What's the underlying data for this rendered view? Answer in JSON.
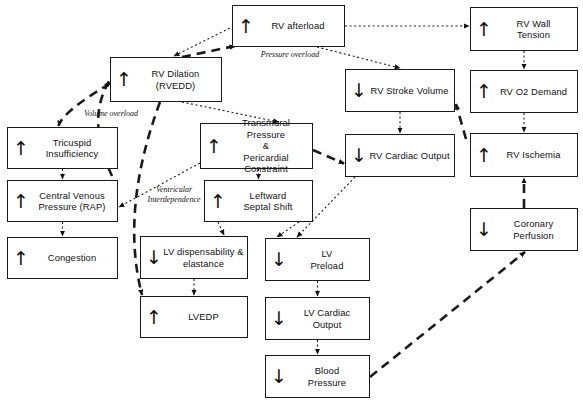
{
  "diagram": {
    "width": 583,
    "height": 404,
    "background": "#ffffff",
    "line_color": "#1a1a1a"
  },
  "nodes": [
    {
      "id": "rv_afterload",
      "label": "RV afterload",
      "arrow": "up",
      "x": 232,
      "y": 5,
      "w": 113,
      "h": 42
    },
    {
      "id": "rv_wall_tension",
      "label": "RV Wall\nTension",
      "arrow": "up",
      "x": 470,
      "y": 7,
      "w": 108,
      "h": 44
    },
    {
      "id": "rv_dilation",
      "label": "RV Dilation\n(RVEDD)",
      "arrow": "up",
      "x": 110,
      "y": 57,
      "w": 112,
      "h": 45
    },
    {
      "id": "rv_stroke_volume",
      "label": "RV Stroke Volume",
      "arrow": "down",
      "x": 345,
      "y": 69,
      "w": 110,
      "h": 43
    },
    {
      "id": "rv_o2_demand",
      "label": "RV O2 Demand",
      "arrow": "up",
      "x": 470,
      "y": 70,
      "w": 108,
      "h": 43
    },
    {
      "id": "tricuspid",
      "label": "Tricuspid\nInsufficiency",
      "arrow": "up",
      "x": 7,
      "y": 127,
      "w": 111,
      "h": 42
    },
    {
      "id": "transmural",
      "label": "Transmural Pressure\n&\nPericardial Constraint",
      "arrow": "up",
      "x": 200,
      "y": 123,
      "w": 113,
      "h": 46
    },
    {
      "id": "rv_cardiac_output",
      "label": "RV Cardiac Output",
      "arrow": "down",
      "x": 345,
      "y": 134,
      "w": 110,
      "h": 43
    },
    {
      "id": "rv_ischemia",
      "label": "RV Ischemia",
      "arrow": "up",
      "x": 470,
      "y": 133,
      "w": 108,
      "h": 44
    },
    {
      "id": "cvp",
      "label": "Central Venous\nPressure (RAP)",
      "arrow": "up",
      "x": 7,
      "y": 180,
      "w": 111,
      "h": 42
    },
    {
      "id": "septal_shift",
      "label": "Leftward\nSeptal Shift",
      "arrow": "up",
      "x": 204,
      "y": 180,
      "w": 109,
      "h": 42
    },
    {
      "id": "coronary_perfusion",
      "label": "Coronary Perfusion",
      "arrow": "down",
      "x": 470,
      "y": 208,
      "w": 108,
      "h": 43
    },
    {
      "id": "congestion",
      "label": "Congestion",
      "arrow": "up",
      "x": 7,
      "y": 237,
      "w": 111,
      "h": 42
    },
    {
      "id": "lv_dispensability",
      "label": "LV dispensability &\nelastance",
      "arrow": "down",
      "x": 140,
      "y": 236,
      "w": 108,
      "h": 43
    },
    {
      "id": "lv_preload",
      "label": "LV\nPreload",
      "arrow": "down",
      "x": 265,
      "y": 238,
      "w": 105,
      "h": 43
    },
    {
      "id": "lvedp",
      "label": "LVEDP",
      "arrow": "up",
      "x": 140,
      "y": 296,
      "w": 108,
      "h": 42
    },
    {
      "id": "lv_cardiac_output",
      "label": "LV Cardiac\nOutput",
      "arrow": "down",
      "x": 265,
      "y": 297,
      "w": 105,
      "h": 43
    },
    {
      "id": "blood_pressure",
      "label": "Blood\nPressure",
      "arrow": "down",
      "x": 265,
      "y": 355,
      "w": 105,
      "h": 43
    }
  ],
  "edge_labels": [
    {
      "id": "pressure_overload",
      "text": "Pressure overload",
      "x": 249,
      "y": 50,
      "w": 82
    },
    {
      "id": "volume_overload",
      "text": "Volume overload",
      "x": 73,
      "y": 109,
      "w": 76
    },
    {
      "id": "ventricular_interdependence",
      "text": "Ventricular\nInterdependence",
      "x": 141,
      "y": 185,
      "w": 66
    }
  ],
  "edges": [
    {
      "id": "rv_afterload-to-rv_wall_tension",
      "style": "dotted",
      "from": "rv_afterload",
      "to": "rv_wall_tension"
    },
    {
      "id": "rv_afterload-to-rv_dilation",
      "style": "dotted",
      "from": "rv_afterload",
      "to": "rv_dilation"
    },
    {
      "id": "rv_afterload-to-rv_stroke_volume",
      "style": "dotted",
      "from": "rv_afterload",
      "to": "rv_stroke_volume"
    },
    {
      "id": "rv_dilation-to-rv_afterload",
      "style": "dashed",
      "from": "rv_dilation",
      "to": "rv_afterload"
    },
    {
      "id": "rv_wall_tension-to-rv_o2_demand",
      "style": "dotted",
      "from": "rv_wall_tension",
      "to": "rv_o2_demand"
    },
    {
      "id": "rv_o2_demand-to-rv_ischemia",
      "style": "dotted",
      "from": "rv_o2_demand",
      "to": "rv_ischemia"
    },
    {
      "id": "rv_stroke_volume-to-rv_cardiac_output",
      "style": "dotted",
      "from": "rv_stroke_volume",
      "to": "rv_cardiac_output"
    },
    {
      "id": "rv_ischemia-to-rv_stroke_volume",
      "style": "dashed",
      "from": "rv_ischemia",
      "to": "rv_stroke_volume"
    },
    {
      "id": "coronary_perfusion-to-rv_ischemia",
      "style": "dashed",
      "from": "coronary_perfusion",
      "to": "rv_ischemia"
    },
    {
      "id": "blood_pressure-to-coronary_perfusion",
      "style": "dashed",
      "from": "blood_pressure",
      "to": "coronary_perfusion"
    },
    {
      "id": "rv_dilation-to-tricuspid",
      "style": "dashed",
      "from": "rv_dilation",
      "to": "tricuspid"
    },
    {
      "id": "tricuspid-to-cvp",
      "style": "dotted",
      "from": "tricuspid",
      "to": "cvp"
    },
    {
      "id": "cvp-to-congestion",
      "style": "dotted",
      "from": "cvp",
      "to": "congestion"
    },
    {
      "id": "cvp-to-rv_dilation",
      "style": "dashed",
      "from": "cvp",
      "to": "rv_dilation"
    },
    {
      "id": "rv_dilation-to-transmural",
      "style": "dotted",
      "from": "rv_dilation",
      "to": "transmural"
    },
    {
      "id": "transmural-to-cvp",
      "style": "dotted",
      "from": "transmural",
      "to": "cvp"
    },
    {
      "id": "transmural-to-rv_cardiac_output",
      "style": "dashed",
      "from": "transmural",
      "to": "rv_cardiac_output"
    },
    {
      "id": "transmural-to-septal_shift",
      "style": "dotted",
      "from": "transmural",
      "to": "septal_shift"
    },
    {
      "id": "septal_shift-to-lv_dispensability",
      "style": "dotted",
      "from": "septal_shift",
      "to": "lv_dispensability"
    },
    {
      "id": "septal_shift-to-lv_preload",
      "style": "dotted",
      "from": "septal_shift",
      "to": "lv_preload"
    },
    {
      "id": "lv_dispensability-to-lvedp",
      "style": "dotted",
      "from": "lv_dispensability",
      "to": "lvedp"
    },
    {
      "id": "rv_dilation-to-lvedp",
      "style": "dashed",
      "from": "rv_dilation",
      "to": "lvedp"
    },
    {
      "id": "rv_cardiac_output-to-lv_preload",
      "style": "dotted",
      "from": "rv_cardiac_output",
      "to": "lv_preload"
    },
    {
      "id": "lv_preload-to-lv_cardiac_output",
      "style": "dotted",
      "from": "lv_preload",
      "to": "lv_cardiac_output"
    },
    {
      "id": "lv_cardiac_output-to-blood_pressure",
      "style": "dotted",
      "from": "lv_cardiac_output",
      "to": "blood_pressure"
    }
  ]
}
